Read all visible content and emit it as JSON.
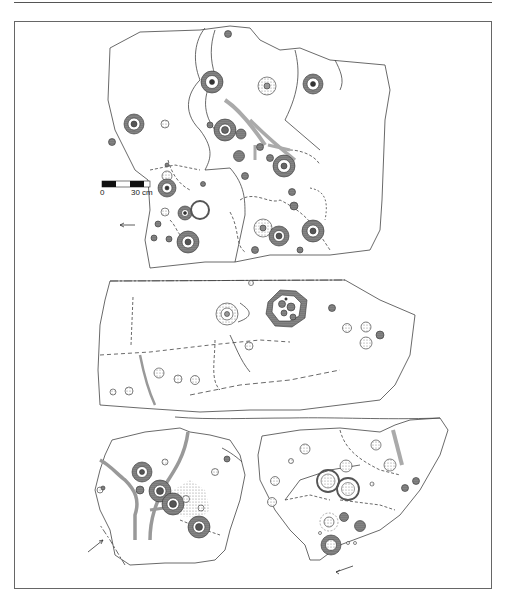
{
  "figure": {
    "type": "archaeological site plan",
    "panels": [
      {
        "id": "upper-rock-surface",
        "description": "Rock surface with cupules and cup-and-ring marks connected by channels"
      },
      {
        "id": "middle-rock-surface",
        "description": "Slab with cup-and-ring mark, cluster ring and cupules"
      },
      {
        "id": "lower-left-rock-surface",
        "description": "Rock surface with ringed cupules and channels"
      },
      {
        "id": "lower-right-rock-surface",
        "description": "Rock surface with concentric rings and cupules"
      }
    ],
    "scale_bar": {
      "start_label": "0",
      "end_label": "30 cm"
    },
    "north_arrows": [
      "arrow-upper",
      "arrow-lower-left",
      "arrow-lower-right"
    ],
    "colors": {
      "line": "#444444",
      "frame": "#666666",
      "fill_dark": "#555555",
      "fill_stipple": "#bbbbbb"
    }
  }
}
